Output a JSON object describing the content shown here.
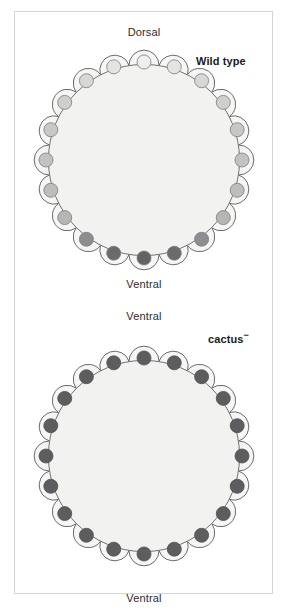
{
  "figure": {
    "kind": "biological-diagram",
    "background_color": "#ffffff",
    "frame_color": "#d4d4d4"
  },
  "panels": [
    {
      "id": "wild-type",
      "genotype_label": "Wild type",
      "genotype_superscript": "",
      "top_axis_label": "Dorsal",
      "bottom_axis_label": "Ventral",
      "cell_count": 20,
      "embryo": {
        "center_x": 144,
        "center_y": 160,
        "body_radius": 96,
        "lobe_radius": 20,
        "nucleus_radius": 7,
        "nucleus_orbit_radius": 98,
        "body_fill": "#f2f2f0",
        "body_stroke": "#59595b",
        "lobe_fill": "#f6f6f4",
        "lobe_stroke": "#59595b",
        "nucleus_stroke": "#7c7c7e"
      },
      "gradient": {
        "description": "Nuclear Dorsal concentration: low at dorsal (top), high at ventral (bottom)",
        "dorsal_color": "#efefee",
        "ventral_color": "#6b6b6d",
        "nucleus_colors": [
          "#efefee",
          "#efefee",
          "#e4e4e2",
          "#e4e4e2",
          "#d7d7d5",
          "#d7d7d5",
          "#cfcfcd",
          "#cfcfcd",
          "#c7c7c5",
          "#c7c7c5",
          "#c2c2c0",
          "#c2c2c0",
          "#bdbdbb",
          "#bdbdbb",
          "#b6b6b4",
          "#b6b6b4",
          "#8e8e90",
          "#8e8e90",
          "#6b6b6d",
          "#6b6b6d",
          "#636365",
          "#636365"
        ]
      }
    },
    {
      "id": "cactus-minus",
      "genotype_label": "cactus",
      "genotype_superscript": "−",
      "top_axis_label": "Ventral",
      "bottom_axis_label": "Ventral",
      "cell_count": 20,
      "embryo": {
        "center_x": 144,
        "center_y": 456,
        "body_radius": 96,
        "lobe_radius": 20,
        "nucleus_radius": 7,
        "nucleus_orbit_radius": 98,
        "body_fill": "#f2f2f0",
        "body_stroke": "#59595b",
        "lobe_fill": "#f6f6f4",
        "lobe_stroke": "#59595b",
        "nucleus_stroke": "#4f4f51"
      },
      "gradient": {
        "description": "Nuclear Dorsal uniformly high around entire circumference (ventralized)",
        "dorsal_color": "#5d5d5f",
        "ventral_color": "#5d5d5f",
        "uniform_color": "#5d5d5f"
      }
    }
  ],
  "chart_data": {
    "type": "scatter",
    "xlabel": "Position around embryo circumference (degrees from ventral pole)",
    "ylabel": "Relative nuclear Dorsal concentration (darkness of nucleus)",
    "categories": [
      "0° (ventral)",
      "18°",
      "36°",
      "54°",
      "72°",
      "90° (lateral)",
      "108°",
      "126°",
      "144°",
      "162°",
      "180° (dorsal)",
      "198°",
      "216°",
      "234°",
      "252°",
      "270° (lateral)",
      "288°",
      "306°",
      "324°",
      "342°"
    ],
    "series": [
      {
        "name": "Wild type",
        "values": [
          1.0,
          0.97,
          0.86,
          0.62,
          0.44,
          0.37,
          0.31,
          0.24,
          0.16,
          0.08,
          0.05,
          0.08,
          0.16,
          0.24,
          0.31,
          0.37,
          0.44,
          0.62,
          0.86,
          0.97
        ]
      },
      {
        "name": "cactus−",
        "values": [
          1.0,
          1.0,
          1.0,
          1.0,
          1.0,
          1.0,
          1.0,
          1.0,
          1.0,
          1.0,
          1.0,
          1.0,
          1.0,
          1.0,
          1.0,
          1.0,
          1.0,
          1.0,
          1.0,
          1.0
        ]
      }
    ],
    "ylim": [
      0,
      1
    ],
    "legend_position": "right",
    "grid": false
  }
}
